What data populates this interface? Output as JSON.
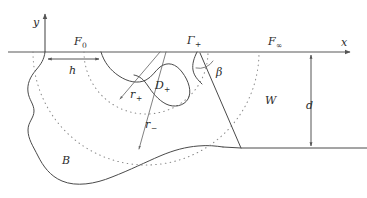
{
  "figure": {
    "type": "geometric-diagram",
    "background_color": "#ffffff",
    "line_color": "#4a4a4a",
    "dotted_color": "#8a8a8a"
  },
  "axes": {
    "x_label": "x",
    "y_label": "y",
    "origin_x": 45,
    "origin_y": 52
  },
  "labels": {
    "f_zero": "F",
    "f_zero_sub": "0",
    "gamma_plus": "Γ",
    "gamma_plus_sub": "+",
    "f_infinity": "F",
    "f_infinity_sub": "∞",
    "h": "h",
    "d": "d",
    "beta": "β",
    "w": "W",
    "b": "B",
    "d_plus": "D",
    "d_plus_sub": "+",
    "r_plus": "r",
    "r_plus_sub": "+",
    "r_minus": "r",
    "r_minus_sub": "−"
  },
  "geometry": {
    "axis_y": 52,
    "axis_x_start": 8,
    "axis_x_end": 355,
    "y_axis_top": 10,
    "h_span_start": 46,
    "h_span_end": 100,
    "h_arrow_y": 59,
    "d_line_x": 311,
    "d_top": 53,
    "d_bottom": 148,
    "bottom_line_y": 148,
    "bottom_line_end": 367,
    "arc_center_x": 146,
    "arc_radius_inner": 62,
    "arc_radius_outer": 113,
    "ray_origin_x": 158,
    "r_plus_end_x": 118,
    "r_plus_end_y": 102,
    "r_minus_end_x": 138,
    "r_minus_end_y": 152,
    "beta_apex_x": 200,
    "beta_apex_y": 52,
    "beta_end_x": 241,
    "beta_end_y": 148
  }
}
